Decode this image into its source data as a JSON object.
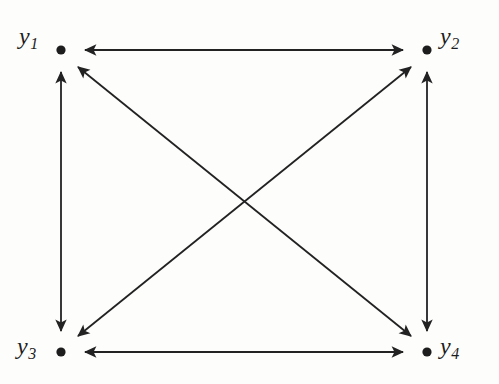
{
  "diagram": {
    "type": "node-link-diagram",
    "background_color": "#fdfdfc",
    "stroke_color": "#222222",
    "node_color": "#1d1d1d",
    "stroke_width": 1.8,
    "node_radius": 4.6,
    "arrowhead": "solid-triangle",
    "nodes": [
      {
        "id": "y1",
        "base": "y",
        "subscript": "1",
        "x": 61,
        "y": 50,
        "label_position": "left"
      },
      {
        "id": "y2",
        "base": "y",
        "subscript": "2",
        "x": 427,
        "y": 50,
        "label_position": "right"
      },
      {
        "id": "y3",
        "base": "y",
        "subscript": "3",
        "x": 61,
        "y": 352,
        "label_position": "left"
      },
      {
        "id": "y4",
        "base": "y",
        "subscript": "4",
        "x": 427,
        "y": 352,
        "label_position": "right"
      }
    ],
    "edges": [
      {
        "id": "edge-y1-y2",
        "from": "y1",
        "to": "y2",
        "direction": "bidirectional",
        "kind": "horizontal-top"
      },
      {
        "id": "edge-y3-y4",
        "from": "y3",
        "to": "y4",
        "direction": "bidirectional",
        "kind": "horizontal-bottom"
      },
      {
        "id": "edge-y1-y3",
        "from": "y1",
        "to": "y3",
        "direction": "bidirectional",
        "kind": "vertical-left"
      },
      {
        "id": "edge-y2-y4",
        "from": "y2",
        "to": "y4",
        "direction": "bidirectional",
        "kind": "vertical-right"
      },
      {
        "id": "edge-y1-y4",
        "from": "y1",
        "to": "y4",
        "direction": "bidirectional",
        "kind": "diagonal-down-right"
      },
      {
        "id": "edge-y2-y3",
        "from": "y2",
        "to": "y3",
        "direction": "bidirectional",
        "kind": "diagonal-down-left"
      }
    ],
    "crossing_point": {
      "x": 243,
      "y": 203
    }
  }
}
